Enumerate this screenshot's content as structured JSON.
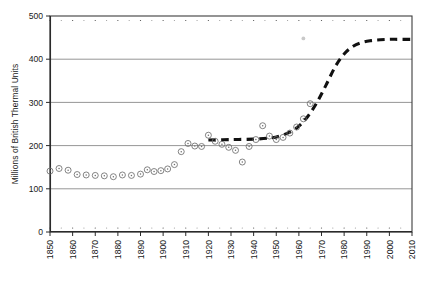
{
  "chart_data": {
    "type": "scatter",
    "title": "",
    "xlabel": "",
    "ylabel": "Millions of British Thermal Units",
    "xlim": [
      1850,
      2010
    ],
    "ylim": [
      0,
      500
    ],
    "ytick_labels": [
      "0",
      "100",
      "200",
      "300",
      "400",
      "500"
    ],
    "ytick_values": [
      0,
      100,
      200,
      300,
      400,
      500
    ],
    "xtick_labels": [
      "1850",
      "1860",
      "1870",
      "1880",
      "1890",
      "1900",
      "1910",
      "1920",
      "1930",
      "1940",
      "1950",
      "1960",
      "1970",
      "1980",
      "1990",
      "2000",
      "2010"
    ],
    "xtick_values": [
      1850,
      1860,
      1870,
      1880,
      1890,
      1900,
      1910,
      1920,
      1930,
      1940,
      1950,
      1960,
      1970,
      1980,
      1990,
      2000,
      2010
    ],
    "grid": "horizontal",
    "legend": "none",
    "series": [
      {
        "name": "Observed energy use per capita",
        "type": "scatter",
        "marker": "circle-dot",
        "color": "#6e6e6e",
        "points": [
          [
            1850,
            141
          ],
          [
            1854,
            147
          ],
          [
            1858,
            143
          ],
          [
            1862,
            133
          ],
          [
            1866,
            132
          ],
          [
            1870,
            131
          ],
          [
            1874,
            130
          ],
          [
            1878,
            128
          ],
          [
            1882,
            132
          ],
          [
            1886,
            131
          ],
          [
            1890,
            134
          ],
          [
            1893,
            144
          ],
          [
            1896,
            140
          ],
          [
            1899,
            142
          ],
          [
            1902,
            146
          ],
          [
            1905,
            156
          ],
          [
            1908,
            186
          ],
          [
            1911,
            205
          ],
          [
            1914,
            199
          ],
          [
            1917,
            198
          ],
          [
            1920,
            224
          ],
          [
            1923,
            210
          ],
          [
            1926,
            203
          ],
          [
            1929,
            196
          ],
          [
            1932,
            189
          ],
          [
            1935,
            162
          ],
          [
            1938,
            198
          ],
          [
            1941,
            214
          ],
          [
            1944,
            246
          ],
          [
            1947,
            222
          ],
          [
            1950,
            214
          ],
          [
            1953,
            219
          ],
          [
            1956,
            229
          ],
          [
            1959,
            243
          ],
          [
            1962,
            262
          ],
          [
            1965,
            297
          ]
        ]
      },
      {
        "name": "Fitted logistic trend",
        "type": "line",
        "style": "dashed",
        "color": "#111111",
        "points": [
          [
            1920,
            213
          ],
          [
            1930,
            214
          ],
          [
            1940,
            215
          ],
          [
            1948,
            218
          ],
          [
            1952,
            223
          ],
          [
            1956,
            231
          ],
          [
            1960,
            245
          ],
          [
            1964,
            268
          ],
          [
            1968,
            300
          ],
          [
            1972,
            340
          ],
          [
            1976,
            382
          ],
          [
            1980,
            412
          ],
          [
            1984,
            430
          ],
          [
            1988,
            439
          ],
          [
            1992,
            443
          ],
          [
            1996,
            445
          ],
          [
            2000,
            446
          ],
          [
            2004,
            446
          ],
          [
            2010,
            446
          ]
        ]
      }
    ],
    "annotations": [
      {
        "name": "stray-mark",
        "x": 1962,
        "y": 448
      }
    ]
  },
  "axis": {
    "frame_color": "#3d3d3d",
    "grid_color": "#8a8a8a",
    "marker_color": "#6e6e6e",
    "curve_color": "#111111"
  }
}
